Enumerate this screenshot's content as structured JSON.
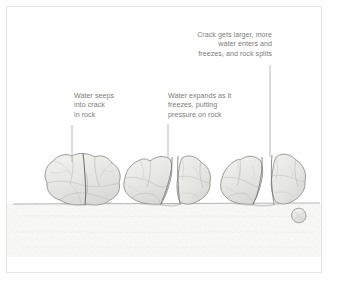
{
  "figure": {
    "type": "illustration-diagram",
    "background_color": "#ffffff",
    "border_color": "#e3e3e3",
    "text_color": "#7c7c7c",
    "rock_fill_color": "#e9e9e7",
    "rock_outline_color": "#8b8b8b",
    "ground_color": "#f4f4f2",
    "leader_line_color": "#b9b9b9"
  },
  "labels": {
    "stage1": {
      "text": "Water seeps\ninto crack\nin rock",
      "align": "left"
    },
    "stage2": {
      "text": "Water expands as it\nfreezes, putting\npressure on rock",
      "align": "left"
    },
    "stage3": {
      "text": "Crack gets larger, more\nwater enters and\nfreezes, and rock splits",
      "align": "right"
    }
  },
  "scene_elements": {
    "ground_label": "ground-surface",
    "rock1_label": "rock-stage-1-intact-with-hairline-crack",
    "rock2_label": "rock-stage-2-widened-crack",
    "rock3_label": "rock-stage-3-split-into-pieces",
    "fragment_label": "broken-rock-fragment"
  }
}
